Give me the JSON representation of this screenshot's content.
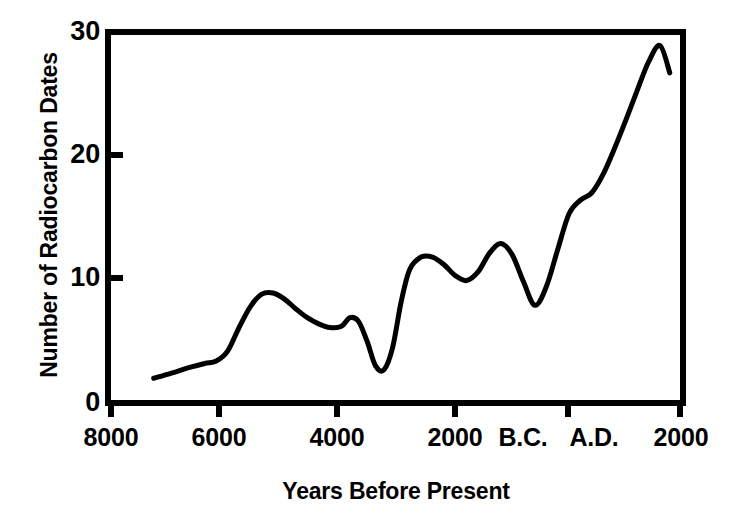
{
  "chart_data": {
    "type": "line",
    "title": "",
    "xlabel": "Years Before Present",
    "ylabel": "Number of Radiocarbon Dates",
    "xlim": [
      8000,
      -2000
    ],
    "ylim": [
      0,
      30
    ],
    "x_tick_labels": [
      "8000",
      "6000",
      "4000",
      "2000",
      "B.C.",
      "A.D.",
      "2000"
    ],
    "x_tick_values": [
      8000,
      6000,
      4000,
      2000,
      0,
      0,
      -2000
    ],
    "y_tick_labels": [
      "0",
      "10",
      "20",
      "30"
    ],
    "y_tick_values": [
      0,
      10,
      20,
      30
    ],
    "grid": false,
    "legend": null,
    "line_color": "#000000",
    "line_width": 5,
    "series": [
      {
        "name": "Number of Radiocarbon Dates",
        "x": [
          7250,
          6950,
          6600,
          6350,
          6150,
          5950,
          5750,
          5550,
          5350,
          5150,
          4950,
          4750,
          4550,
          4350,
          4150,
          3950,
          3800,
          3650,
          3500,
          3350,
          3200,
          3050,
          2900,
          2750,
          2550,
          2350,
          2150,
          1950,
          1750,
          1550,
          1350,
          1150,
          950,
          750,
          550,
          350,
          150,
          -50,
          -250,
          -450,
          -650,
          -850,
          -1050,
          -1250,
          -1450,
          -1650,
          -1820
        ],
        "y": [
          2.0,
          2.4,
          2.9,
          3.2,
          3.4,
          4.2,
          6.1,
          7.8,
          8.8,
          8.9,
          8.4,
          7.6,
          6.9,
          6.4,
          6.1,
          6.2,
          6.9,
          6.6,
          5.0,
          3.0,
          2.7,
          4.5,
          8.2,
          10.8,
          11.8,
          11.8,
          11.2,
          10.3,
          9.9,
          10.6,
          12.1,
          12.9,
          12.0,
          9.8,
          7.9,
          9.4,
          12.4,
          15.3,
          16.4,
          17.0,
          18.5,
          20.6,
          22.9,
          25.3,
          27.6,
          28.9,
          26.7
        ]
      }
    ],
    "annotations": []
  },
  "axes": {
    "y_ticks": [
      {
        "label": "30",
        "value": 30
      },
      {
        "label": "20",
        "value": 20
      },
      {
        "label": "10",
        "value": 10
      },
      {
        "label": "0",
        "value": 0
      }
    ],
    "x_ticks": [
      {
        "label": "8000",
        "value": 8000
      },
      {
        "label": "6000",
        "value": 6000
      },
      {
        "label": "4000",
        "value": 4000
      },
      {
        "label": "2000",
        "value": 2000
      },
      {
        "label": "B.C.",
        "value": 0
      },
      {
        "label": "A.D.",
        "value": 0
      },
      {
        "label": "2000",
        "value": -2000
      }
    ],
    "y_axis_title": "Number of Radiocarbon Dates",
    "x_axis_title": "Years Before Present"
  },
  "colors": {
    "line": "#000000",
    "frame": "#000000",
    "background": "#ffffff",
    "text": "#000000"
  }
}
